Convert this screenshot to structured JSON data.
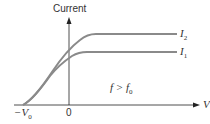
{
  "diagram": {
    "y_axis_label": "Current",
    "x_axis_label": "V",
    "origin_label": "0",
    "stopping_voltage_label": "−V",
    "stopping_voltage_sub": "0",
    "condition_label": "f > f",
    "condition_sub": "0",
    "curves": [
      {
        "name": "I",
        "sub": "2",
        "description": "higher intensity, higher saturation current"
      },
      {
        "name": "I",
        "sub": "1",
        "description": "lower intensity, lower saturation current"
      }
    ],
    "colors": {
      "curve": "#8a8a8a",
      "axis": "#222222",
      "text": "#333333"
    }
  }
}
